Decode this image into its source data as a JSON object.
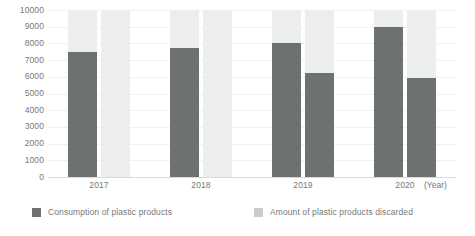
{
  "chart_data": {
    "type": "bar",
    "title": "",
    "subtitle": "",
    "xlabel": "(Year)",
    "ylabel": "",
    "categories": [
      "2017",
      "2018",
      "2019",
      "2020"
    ],
    "ylim": [
      0,
      10000
    ],
    "ytick_labels": [
      "10000",
      "9000",
      "8000",
      "7000",
      "6000",
      "5000",
      "4000",
      "3000",
      "2000",
      "1000",
      "0"
    ],
    "ytick_values": [
      10000,
      9000,
      8000,
      7000,
      6000,
      5000,
      4000,
      3000,
      2000,
      1000,
      0
    ],
    "grid": true,
    "legend_position": "bottom",
    "bar_background_to_max": true,
    "series": [
      {
        "name": "Consumption of plastic products",
        "color": "#6e7172",
        "values": [
          7500,
          7700,
          8000,
          9000
        ]
      },
      {
        "name": "Amount of plastic products discarded",
        "color": "#6e7172",
        "values": [
          0,
          0,
          6200,
          5900
        ]
      }
    ],
    "colors": {
      "bar_fill": "#6e7172",
      "bar_track": "#ecedee",
      "gridline": "#f0f1f1",
      "axis": "#d8dadb",
      "text": "#76797a",
      "legend_swatch_light": "#c9cbcc",
      "background": "#ffffff"
    }
  },
  "legend": {
    "items": [
      {
        "label": "Consumption of plastic products"
      },
      {
        "label": "Amount of plastic products discarded"
      }
    ]
  },
  "axis": {
    "unit_label": "(Year)"
  }
}
